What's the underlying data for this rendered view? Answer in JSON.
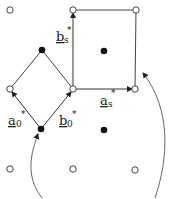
{
  "diagram": {
    "type": "reciprocal-lattice",
    "colors": {
      "line": "#444444",
      "open_point_fill": "#ffffff",
      "filled_point": "#111111",
      "background": "#ffffff"
    },
    "open_points": [
      {
        "x": 10,
        "y": 10
      },
      {
        "x": 73,
        "y": 10
      },
      {
        "x": 136,
        "y": 10
      },
      {
        "x": 10,
        "y": 89
      },
      {
        "x": 73,
        "y": 89
      },
      {
        "x": 135,
        "y": 89
      },
      {
        "x": 10,
        "y": 169
      },
      {
        "x": 73,
        "y": 169
      },
      {
        "x": 135,
        "y": 170
      }
    ],
    "filled_points": [
      {
        "x": 42,
        "y": 50
      },
      {
        "x": 104,
        "y": 51
      },
      {
        "x": 41,
        "y": 129
      },
      {
        "x": 104,
        "y": 130
      }
    ],
    "vectors": {
      "a0": {
        "base": "a",
        "sub": "0",
        "sup": "*"
      },
      "b0": {
        "base": "b",
        "sub": "0",
        "sup": "*"
      },
      "as": {
        "base": "a",
        "sub": "s",
        "sup": "*"
      },
      "bs": {
        "base": "b",
        "sub": "s",
        "sup": "*"
      }
    }
  }
}
